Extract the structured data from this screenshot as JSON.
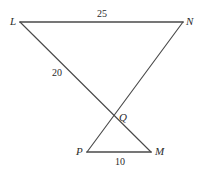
{
  "figure": {
    "type": "geometry-diagram",
    "background_color": "#ffffff",
    "stroke_color": "#444444",
    "label_color": "#2b2b2b",
    "width": 205,
    "height": 173,
    "vertices": [
      {
        "id": "L",
        "label": "L",
        "x": 20,
        "y": 22,
        "label_x": 10,
        "label_y": 16
      },
      {
        "id": "N",
        "label": "N",
        "x": 183,
        "y": 22,
        "label_x": 186,
        "label_y": 16
      },
      {
        "id": "Q",
        "label": "Q",
        "x": 113,
        "y": 116,
        "label_x": 119,
        "label_y": 112
      },
      {
        "id": "P",
        "label": "P",
        "x": 87,
        "y": 152,
        "label_x": 76,
        "label_y": 146
      },
      {
        "id": "M",
        "label": "M",
        "x": 151,
        "y": 152,
        "label_x": 155,
        "label_y": 146
      }
    ],
    "segments": [
      {
        "id": "LN",
        "from": "L",
        "to": "N",
        "x1": 20,
        "y1": 22,
        "x2": 183,
        "y2": 22,
        "width": 1.6
      },
      {
        "id": "LM",
        "from": "L",
        "to": "M",
        "x1": 20,
        "y1": 22,
        "x2": 151,
        "y2": 152,
        "width": 1.2
      },
      {
        "id": "NP",
        "from": "N",
        "to": "P",
        "x1": 183,
        "y1": 22,
        "x2": 87,
        "y2": 152,
        "width": 1.2
      },
      {
        "id": "PM",
        "from": "P",
        "to": "M",
        "x1": 87,
        "y1": 152,
        "x2": 151,
        "y2": 152,
        "width": 1.6
      }
    ],
    "measures": [
      {
        "id": "LN-length",
        "segment": "LN",
        "value": "25",
        "x": 97,
        "y": 9
      },
      {
        "id": "LQ-length",
        "segment": "LQ",
        "value": "20",
        "x": 52,
        "y": 68
      },
      {
        "id": "PM-length",
        "segment": "PM",
        "value": "10",
        "x": 115,
        "y": 157
      }
    ]
  }
}
